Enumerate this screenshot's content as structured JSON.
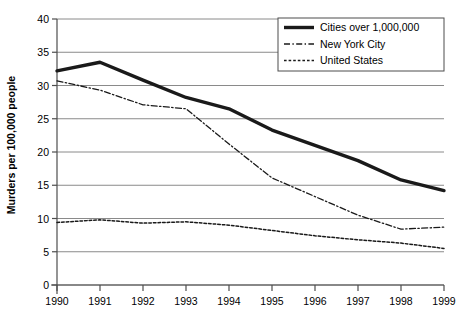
{
  "chart_data": {
    "type": "line",
    "title": "",
    "xlabel": "",
    "ylabel": "Murders per 100,000 people",
    "categories": [
      "1990",
      "1991",
      "1992",
      "1993",
      "1994",
      "1995",
      "1996",
      "1997",
      "1998",
      "1999"
    ],
    "x": [
      1990,
      1991,
      1992,
      1993,
      1994,
      1995,
      1996,
      1997,
      1998,
      1999
    ],
    "xlim": [
      1990,
      1999
    ],
    "ylim": [
      0,
      40
    ],
    "yticks": [
      0,
      5,
      10,
      15,
      20,
      25,
      30,
      35,
      40
    ],
    "ytick_labels": [
      "0",
      "5",
      "10",
      "15",
      "20",
      "25",
      "30",
      "35",
      "40"
    ],
    "xtick_labels": [
      "1990",
      "1991",
      "1992",
      "1993",
      "1994",
      "1995",
      "1996",
      "1997",
      "1998",
      "1999"
    ],
    "grid": "horizontal",
    "legend_position": "top-right",
    "series": [
      {
        "name": "Cities over 1,000,000",
        "style": "solid-thick",
        "color": "#1a1a1a",
        "values": [
          32.2,
          33.5,
          30.8,
          28.2,
          26.5,
          23.3,
          21.0,
          18.7,
          15.8,
          14.2
        ]
      },
      {
        "name": "New York City",
        "style": "dash-dot",
        "color": "#1a1a1a",
        "values": [
          30.7,
          29.3,
          27.1,
          26.5,
          21.2,
          16.1,
          13.3,
          10.5,
          8.4,
          8.7
        ]
      },
      {
        "name": "United States",
        "style": "dotted",
        "color": "#1a1a1a",
        "values": [
          9.4,
          9.8,
          9.3,
          9.5,
          9.0,
          8.2,
          7.4,
          6.8,
          6.3,
          5.5
        ]
      }
    ]
  },
  "legend": {
    "entries": [
      {
        "label": "Cities over 1,000,000"
      },
      {
        "label": "New York City"
      },
      {
        "label": "United States"
      }
    ]
  },
  "colors": {
    "line": "#1a1a1a",
    "grid": "#8a8a8a",
    "axis": "#4d4d4d",
    "background": "#ffffff"
  }
}
